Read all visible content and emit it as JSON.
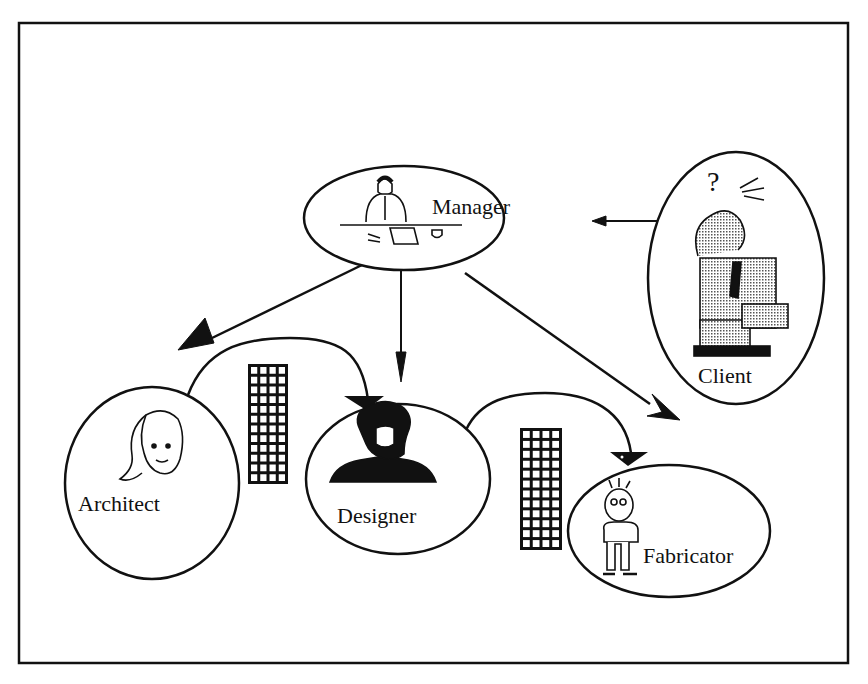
{
  "diagram": {
    "nodes": [
      {
        "id": "manager",
        "label": "Manager",
        "figure": "man at desk with papers and coffee cup"
      },
      {
        "id": "client",
        "label": "Client",
        "figure": "confused man scratching head with question mark",
        "glyph": "?"
      },
      {
        "id": "architect",
        "label": "Architect",
        "figure": "woman with scarf"
      },
      {
        "id": "designer",
        "label": "Designer",
        "figure": "bearded man bust"
      },
      {
        "id": "fabricator",
        "label": "Fabricator",
        "figure": "standing cartoon man"
      }
    ],
    "edges": [
      {
        "from": "client",
        "to": "manager",
        "style": "straight arrow"
      },
      {
        "from": "manager",
        "to": "architect",
        "style": "straight arrow"
      },
      {
        "from": "manager",
        "to": "designer",
        "style": "straight arrow"
      },
      {
        "from": "manager",
        "to": "fabricator",
        "style": "straight arrow"
      },
      {
        "from": "architect",
        "to": "designer",
        "style": "curved arrow",
        "artifact": "grid document"
      },
      {
        "from": "designer",
        "to": "fabricator",
        "style": "curved arrow",
        "artifact": "grid document"
      }
    ],
    "colors": {
      "ink": "#111111",
      "background": "#ffffff",
      "stipple": "#9a9a9a"
    }
  }
}
